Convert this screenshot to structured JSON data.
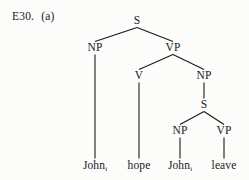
{
  "figure": {
    "example_number": "E30.",
    "sub_label": "(a)",
    "background_color": "#fcfcfb",
    "ink_color": "#1a1a1a"
  },
  "tree": {
    "nodes": [
      {
        "id": "S1",
        "label": "S",
        "x": 137,
        "y": 21
      },
      {
        "id": "NP1",
        "label": "NP",
        "x": 95,
        "y": 48
      },
      {
        "id": "VP1",
        "label": "VP",
        "x": 173,
        "y": 48
      },
      {
        "id": "V1",
        "label": "V",
        "x": 139,
        "y": 76
      },
      {
        "id": "NP2",
        "label": "NP",
        "x": 204,
        "y": 76
      },
      {
        "id": "S2",
        "label": "S",
        "x": 204,
        "y": 105
      },
      {
        "id": "NP3",
        "label": "NP",
        "x": 180,
        "y": 131
      },
      {
        "id": "VP2",
        "label": "VP",
        "x": 224,
        "y": 131
      }
    ],
    "edges": [
      {
        "from": "S1",
        "to": "NP1"
      },
      {
        "from": "S1",
        "to": "VP1"
      },
      {
        "from": "VP1",
        "to": "V1"
      },
      {
        "from": "VP1",
        "to": "NP2"
      },
      {
        "from": "NP2",
        "to": "S2"
      },
      {
        "from": "S2",
        "to": "NP3"
      },
      {
        "from": "S2",
        "to": "VP2"
      },
      {
        "from": "NP1",
        "to": "L1"
      },
      {
        "from": "V1",
        "to": "L2"
      },
      {
        "from": "NP3",
        "to": "L3"
      },
      {
        "from": "VP2",
        "to": "L4"
      }
    ],
    "leaves": [
      {
        "id": "L1",
        "text": "John",
        "subscript": "i",
        "x": 95,
        "y": 166
      },
      {
        "id": "L2",
        "text": "hope",
        "subscript": "",
        "x": 139,
        "y": 166
      },
      {
        "id": "L3",
        "text": "John",
        "subscript": "i",
        "x": 180,
        "y": 166
      },
      {
        "id": "L4",
        "text": "leave",
        "subscript": "",
        "x": 224,
        "y": 166
      }
    ],
    "sentence": "John_i hope John_i leave"
  }
}
